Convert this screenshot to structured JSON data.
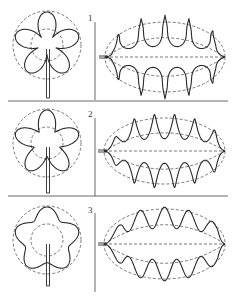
{
  "figure": {
    "width": 237,
    "height": 298,
    "stroke_color": "#2a2a2a",
    "dash_color": "#555555",
    "divider_color": "#444444",
    "panels": [
      {
        "label": "1",
        "label_pos": [
          88,
          14
        ],
        "top": 0,
        "rosette": {
          "cx": 47,
          "cy": 45,
          "outer_r": 34,
          "inner_r": 16,
          "petals": 5,
          "lobe_depth": 0.92,
          "petal_sharpness": 6,
          "stem_bottom": 98
        },
        "leaf": {
          "x0": 105,
          "x1": 225,
          "cy": 57,
          "ry": 35,
          "waves_top": 5,
          "waves_bottom": 5,
          "amplitude": 0.95,
          "style": "deep"
        },
        "vline": {
          "x": 95,
          "y0": 22,
          "y1": 100
        },
        "divider_y": 101
      },
      {
        "label": "2",
        "label_pos": [
          88,
          110
        ],
        "top": 98,
        "rosette": {
          "cx": 47,
          "cy": 143,
          "outer_r": 34,
          "inner_r": 16,
          "petals": 5,
          "lobe_depth": 0.75,
          "petal_sharpness": 3,
          "stem_bottom": 193
        },
        "leaf": {
          "x0": 104,
          "x1": 225,
          "cy": 151,
          "ry": 33,
          "waves_top": 6,
          "waves_bottom": 6,
          "amplitude": 0.6,
          "style": "medium"
        },
        "vline": {
          "x": 95,
          "y0": 118,
          "y1": 196
        },
        "divider_y": 196
      },
      {
        "label": "3",
        "label_pos": [
          88,
          206
        ],
        "top": 196,
        "rosette": {
          "cx": 47,
          "cy": 240,
          "outer_r": 34,
          "inner_r": 16,
          "petals": 5,
          "lobe_depth": 0.38,
          "petal_sharpness": 1.5,
          "stem_bottom": 286
        },
        "leaf": {
          "x0": 104,
          "x1": 225,
          "cy": 244,
          "ry": 35,
          "waves_top": 5,
          "waves_bottom": 5,
          "amplitude": 0.25,
          "style": "shallow"
        },
        "vline": {
          "x": 95,
          "y0": 213,
          "y1": 292
        },
        "divider_y": null
      }
    ]
  }
}
